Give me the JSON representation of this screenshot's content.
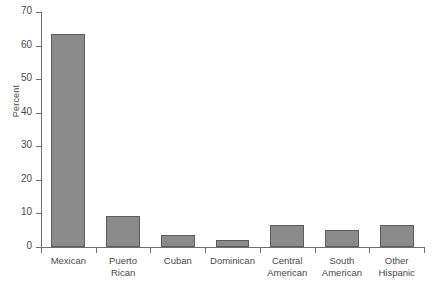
{
  "chart_data": {
    "type": "bar",
    "title": "",
    "xlabel": "",
    "ylabel": "Percent",
    "categories": [
      "Mexican",
      "Puerto\nRican",
      "Cuban",
      "Dominican",
      "Central\nAmerican",
      "South\nAmerican",
      "Other\nHispanic"
    ],
    "values": [
      63.5,
      9.3,
      3.5,
      2.0,
      6.5,
      5.0,
      6.5
    ],
    "ylim": [
      0,
      70
    ],
    "yticks": [
      0,
      10,
      20,
      30,
      40,
      50,
      60,
      70
    ],
    "ytick_labels": [
      "0",
      "10",
      "20",
      "30",
      "40",
      "50",
      "60",
      "70"
    ],
    "grid": false,
    "legend": false,
    "bar_color": "#8b8b8b",
    "bar_edge_color": "#5c5c5c",
    "axis_color": "#6f6f6f",
    "background": "#ffffff"
  }
}
